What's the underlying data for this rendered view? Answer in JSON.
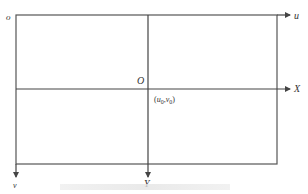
{
  "diagram": {
    "type": "coordinate-systems",
    "colors": {
      "line": "#444444",
      "text": "#333333",
      "background": "#ffffff"
    },
    "labels": {
      "pixel_origin": "o",
      "u_axis": "u",
      "v_axis": "v",
      "image_origin": "O",
      "x_axis": "X",
      "y_axis": "Y",
      "principal_point": "(u0,v0)",
      "principal_point_u": "u",
      "principal_point_u_sub": "0",
      "principal_point_v": "v",
      "principal_point_v_sub": "0"
    },
    "geometry": {
      "rect": {
        "x": 16,
        "y": 15,
        "width": 261,
        "height": 149
      },
      "center": {
        "x": 148,
        "y": 89
      },
      "u_arrow_end": 290,
      "x_arrow_end": 290,
      "v_arrow_end": 177,
      "y_arrow_end": 177
    }
  }
}
